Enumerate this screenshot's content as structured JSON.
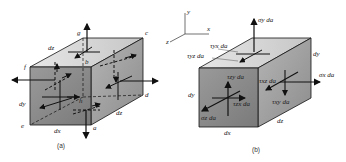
{
  "figure_a": {
    "caption": "(a)",
    "vertices": {
      "a": "a",
      "b": "b",
      "c": "c",
      "d": "d",
      "e": "e",
      "f": "f",
      "g": "g",
      "h": "h"
    },
    "dims": {
      "dx": "dx",
      "dy": "dy",
      "dz_top": "dz",
      "dz_side": "dz"
    }
  },
  "figure_b": {
    "caption": "(b)",
    "axes": {
      "x": "x",
      "y": "y",
      "z": "z"
    },
    "forces": {
      "sigma_y": "σy da",
      "tau_yx": "τyx da",
      "tau_yz": "τyz da",
      "tau_zy": "τzy da",
      "tau_zx": "τzx da",
      "sigma_z": "σz da",
      "tau_xz": "τxz da",
      "tau_xy": "τxy da",
      "sigma_x": "σx da"
    },
    "dims": {
      "dx": "dx",
      "dy_front": "dy",
      "dy_side": "dy",
      "dz": "dz"
    }
  },
  "colors": {
    "front_face": "#8a8a8a",
    "top_face": "#d4d4d4",
    "side_face": "#a6a6a6",
    "line": "#111111"
  }
}
